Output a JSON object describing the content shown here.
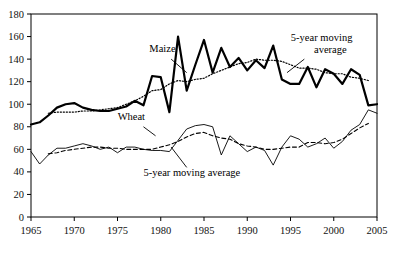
{
  "chart_data": {
    "type": "line",
    "title": "",
    "xlabel": "",
    "ylabel": "",
    "xlim": [
      1965,
      2005
    ],
    "ylim": [
      0,
      180
    ],
    "xticks": [
      1965,
      1970,
      1975,
      1980,
      1985,
      1990,
      1995,
      2000,
      2005
    ],
    "yticks": [
      0,
      20,
      40,
      60,
      80,
      100,
      120,
      140,
      160,
      180
    ],
    "grid": false,
    "legend": "none",
    "annotations": [
      {
        "text": "Maize",
        "series": "maize",
        "x": 1981.0,
        "y": 148
      },
      {
        "text": "5-year moving average",
        "series": "maize_ma5",
        "x": 1997.5,
        "y": 152
      },
      {
        "text": "Wheat",
        "series": "wheat",
        "x": 1977.5,
        "y": 84
      },
      {
        "text": "5-year moving average",
        "series": "wheat_ma5",
        "x": 1982.5,
        "y": 40
      }
    ],
    "x": [
      1965,
      1966,
      1967,
      1968,
      1969,
      1970,
      1971,
      1972,
      1973,
      1974,
      1975,
      1976,
      1977,
      1978,
      1979,
      1980,
      1981,
      1982,
      1983,
      1984,
      1985,
      1986,
      1987,
      1988,
      1989,
      1990,
      1991,
      1992,
      1993,
      1994,
      1995,
      1996,
      1997,
      1998,
      1999,
      2000,
      2001,
      2002,
      2003,
      2004,
      2005
    ],
    "series": [
      {
        "name": "Maize",
        "style": "solid-bold",
        "values": [
          82,
          84,
          90,
          97,
          100,
          101,
          97,
          95,
          94,
          94,
          96,
          98,
          103,
          99,
          125,
          124,
          93,
          160,
          112,
          135,
          157,
          128,
          150,
          133,
          141,
          130,
          139,
          132,
          152,
          122,
          118,
          118,
          133,
          115,
          131,
          127,
          118,
          131,
          126,
          99,
          100
        ]
      },
      {
        "name": "Maize 5-year moving average",
        "style": "dotted",
        "values": [
          null,
          null,
          92,
          93,
          93,
          93,
          94,
          94,
          95,
          96,
          97,
          100,
          103,
          107,
          112,
          113,
          118,
          121,
          120,
          122,
          123,
          127,
          130,
          133,
          136,
          137,
          140,
          139,
          139,
          138,
          135,
          132,
          132,
          131,
          128,
          127,
          127,
          124,
          123,
          121,
          null
        ]
      },
      {
        "name": "Wheat",
        "style": "solid-thin",
        "values": [
          58,
          47,
          55,
          61,
          61,
          63,
          65,
          63,
          60,
          62,
          57,
          62,
          62,
          60,
          59,
          59,
          58,
          68,
          78,
          81,
          82,
          80,
          55,
          72,
          65,
          58,
          62,
          59,
          46,
          62,
          72,
          69,
          62,
          65,
          70,
          61,
          67,
          77,
          82,
          95,
          92
        ]
      },
      {
        "name": "Wheat 5-year moving average",
        "style": "dashed",
        "values": [
          null,
          null,
          56,
          57,
          59,
          60,
          61,
          62,
          62,
          61,
          61,
          60,
          60,
          60,
          60,
          62,
          64,
          67,
          71,
          74,
          75,
          72,
          70,
          69,
          65,
          63,
          62,
          60,
          60,
          61,
          62,
          62,
          66,
          66,
          65,
          66,
          69,
          74,
          79,
          83,
          null
        ]
      }
    ]
  },
  "axes": {
    "y_tick_labels": [
      "180",
      "160",
      "140",
      "120",
      "100",
      "80",
      "60",
      "40",
      "20",
      "0"
    ],
    "x_tick_labels": [
      "1965",
      "1970",
      "1975",
      "1980",
      "1985",
      "1990",
      "1995",
      "2000",
      "2005"
    ]
  },
  "labels": {
    "maize": "Maize",
    "wheat": "Wheat",
    "maize_ma_line1": "5-year moving",
    "maize_ma_line2": "average",
    "wheat_ma": "5-year moving average"
  },
  "colors": {
    "line": "#000000",
    "axis": "#000000",
    "background": "#ffffff"
  }
}
